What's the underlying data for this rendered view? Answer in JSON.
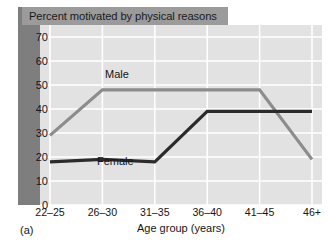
{
  "figure": {
    "caption_label": "(a)",
    "title": "Percent motivated by physical reasons"
  },
  "chart_data": {
    "type": "line",
    "title": "Percent motivated by physical reasons",
    "xlabel": "Age group (years)",
    "ylabel": "",
    "categories": [
      "22–25",
      "26–30",
      "31–35",
      "36–40",
      "41–45",
      "46+"
    ],
    "ylim": [
      0,
      75
    ],
    "yticks": [
      0,
      10,
      20,
      30,
      40,
      50,
      60,
      70
    ],
    "ytick_labels": [
      "0",
      "10",
      "20",
      "30",
      "40",
      "50",
      "60",
      "70"
    ],
    "grid": true,
    "legend": "inline-labels",
    "series": [
      {
        "name": "Male",
        "color": "#8c8c8c",
        "values": [
          29,
          48,
          48,
          48,
          48,
          19
        ]
      },
      {
        "name": "Female",
        "color": "#2b2b2b",
        "values": [
          18,
          19,
          18,
          39,
          39,
          39
        ]
      }
    ],
    "annotations": [
      {
        "text": "Male",
        "series": "Male"
      },
      {
        "text": "Female",
        "series": "Female"
      }
    ]
  },
  "colors": {
    "panel_background": "#e2e2e2",
    "gridline": "#ffffff",
    "title_banner": "#9b9b9b",
    "left_band": "#7e7e7e",
    "male_line": "#8c8c8c",
    "female_line": "#2b2b2b",
    "text": "#151515"
  }
}
